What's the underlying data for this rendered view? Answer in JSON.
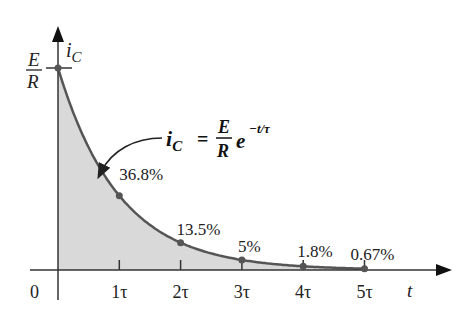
{
  "chart_data": {
    "type": "area",
    "title": "",
    "xlabel": "t",
    "ylabel": "i_C",
    "y_max_label": {
      "numerator": "E",
      "denominator": "R"
    },
    "origin_label": "0",
    "x_ticks": [
      "1τ",
      "2τ",
      "3τ",
      "4τ",
      "5τ"
    ],
    "x": [
      0,
      1,
      2,
      3,
      4,
      5
    ],
    "values": [
      100,
      36.8,
      13.5,
      5,
      1.8,
      0.67
    ],
    "point_labels": [
      "",
      "36.8%",
      "13.5%",
      "5%",
      "1.8%",
      "0.67%"
    ],
    "units": "% of E/R",
    "equation": {
      "lhs": "i",
      "lhs_sub": "C",
      "eq": "=",
      "num": "E",
      "den": "R",
      "base": "e",
      "exponent": "−t/τ"
    },
    "ylim": [
      0,
      100
    ],
    "xlim": [
      0,
      5
    ],
    "grid": false,
    "fill_color": "#d9d9d9",
    "curve_color": "#555555",
    "axis_color": "#333333"
  }
}
